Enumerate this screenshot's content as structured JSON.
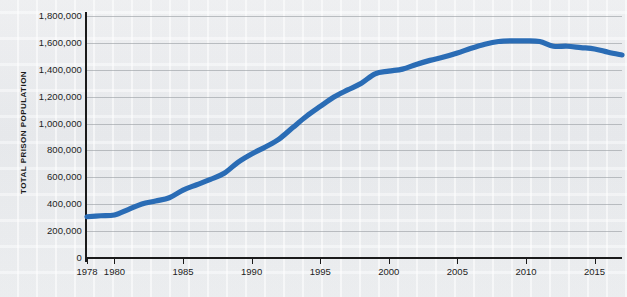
{
  "chart_data": {
    "type": "line",
    "title": "",
    "xlabel": "",
    "ylabel": "TOTAL PRISON POPULATION",
    "xlim": [
      1978,
      2017
    ],
    "ylim": [
      0,
      1800000
    ],
    "grid": true,
    "legend": "none",
    "line_color": "#2a6cb5",
    "x_tick_labels": [
      "1978",
      "1980",
      "1985",
      "1990",
      "1995",
      "2000",
      "2005",
      "2010",
      "2015"
    ],
    "x_ticks": [
      1978,
      1980,
      1985,
      1990,
      1995,
      2000,
      2005,
      2010,
      2015
    ],
    "y_tick_labels": [
      "1,800,000",
      "1,600,000",
      "1,400,000",
      "1,200,000",
      "1,000,000",
      "800,000",
      "600,000",
      "400,000",
      "200,000",
      "0"
    ],
    "y_ticks": [
      1800000,
      1600000,
      1400000,
      1200000,
      1000000,
      800000,
      600000,
      400000,
      200000,
      0
    ],
    "series": [
      {
        "name": "Total prison population",
        "x": [
          1978,
          1979,
          1980,
          1981,
          1982,
          1983,
          1984,
          1985,
          1986,
          1987,
          1988,
          1989,
          1990,
          1991,
          1992,
          1993,
          1994,
          1995,
          1996,
          1997,
          1998,
          1999,
          2000,
          2001,
          2002,
          2003,
          2004,
          2005,
          2006,
          2007,
          2008,
          2009,
          2010,
          2011,
          2012,
          2013,
          2014,
          2015,
          2016,
          2017
        ],
        "values": [
          307000,
          314000,
          320000,
          360000,
          402000,
          424000,
          448000,
          505000,
          545000,
          585000,
          630000,
          712000,
          774000,
          826000,
          884000,
          970000,
          1054000,
          1127000,
          1197000,
          1250000,
          1300000,
          1370000,
          1390000,
          1405000,
          1440000,
          1470000,
          1495000,
          1525000,
          1560000,
          1590000,
          1610000,
          1615000,
          1615000,
          1610000,
          1575000,
          1575000,
          1565000,
          1555000,
          1530000,
          1510000
        ]
      }
    ]
  }
}
